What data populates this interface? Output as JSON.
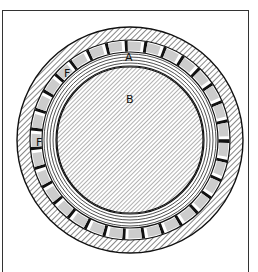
{
  "figure": {
    "type": "cross-section of a roller bearing",
    "labels": {
      "outer_race": "",
      "inner_race": "A",
      "shaft": "B",
      "roller_1": "F",
      "roller_2": "F"
    },
    "colors": {
      "ink": "#111111",
      "background": "#ffffff",
      "hatch": "#333333"
    }
  }
}
